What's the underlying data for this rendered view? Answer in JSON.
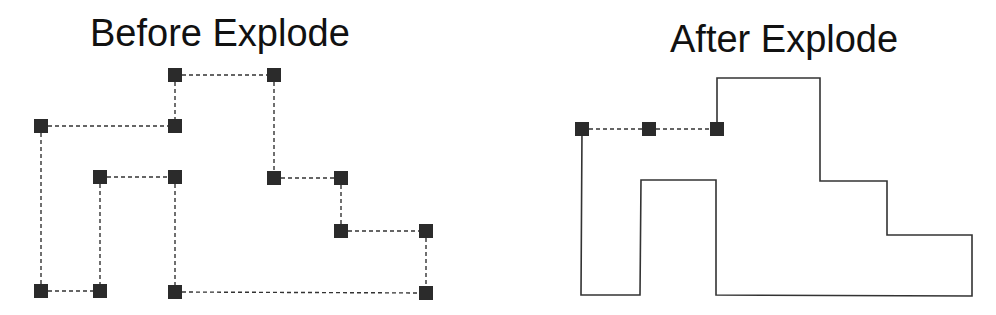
{
  "titles": {
    "before": "Before Explode",
    "after": "After Explode"
  },
  "colors": {
    "line": "#333333",
    "vertex": "#2b2b2b",
    "background": "#ffffff"
  },
  "before": {
    "line_style": "dashed",
    "vertices": [
      [
        175,
        75
      ],
      [
        274,
        75
      ],
      [
        41,
        126
      ],
      [
        175,
        126
      ],
      [
        100,
        177
      ],
      [
        175,
        177
      ],
      [
        274,
        178
      ],
      [
        341,
        178
      ],
      [
        341,
        231
      ],
      [
        426,
        231
      ],
      [
        41,
        291
      ],
      [
        100,
        291
      ],
      [
        175,
        292
      ],
      [
        426,
        293
      ]
    ],
    "edges": [
      [
        [
          175,
          75
        ],
        [
          274,
          75
        ]
      ],
      [
        [
          175,
          75
        ],
        [
          175,
          126
        ]
      ],
      [
        [
          41,
          126
        ],
        [
          175,
          126
        ]
      ],
      [
        [
          41,
          126
        ],
        [
          41,
          291
        ]
      ],
      [
        [
          41,
          291
        ],
        [
          100,
          291
        ]
      ],
      [
        [
          100,
          177
        ],
        [
          100,
          291
        ]
      ],
      [
        [
          100,
          177
        ],
        [
          175,
          177
        ]
      ],
      [
        [
          175,
          177
        ],
        [
          175,
          292
        ]
      ],
      [
        [
          175,
          292
        ],
        [
          426,
          293
        ]
      ],
      [
        [
          426,
          231
        ],
        [
          426,
          293
        ]
      ],
      [
        [
          341,
          231
        ],
        [
          426,
          231
        ]
      ],
      [
        [
          341,
          178
        ],
        [
          341,
          231
        ]
      ],
      [
        [
          274,
          178
        ],
        [
          341,
          178
        ]
      ],
      [
        [
          274,
          75
        ],
        [
          274,
          178
        ]
      ]
    ]
  },
  "after": {
    "selected_segment": {
      "line_style": "dashed",
      "vertices": [
        [
          582,
          129
        ],
        [
          649,
          129
        ],
        [
          717,
          129
        ]
      ]
    },
    "outline": {
      "line_style": "solid",
      "points": "717,129 717,78 820,78 820,181 887,181 887,235 972,235 972,296 716,295 716,180 641,180 640,295 581,295 582,129"
    }
  }
}
